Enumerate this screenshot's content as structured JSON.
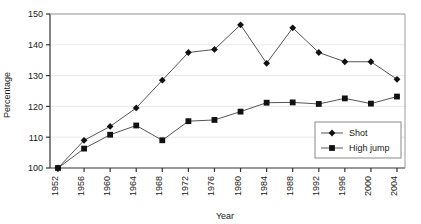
{
  "chart_data": {
    "type": "line",
    "title": "",
    "xlabel": "Year",
    "ylabel": "Percentage",
    "categories": [
      1952,
      1956,
      1960,
      1964,
      1968,
      1972,
      1976,
      1980,
      1984,
      1988,
      1992,
      1996,
      2000,
      2004
    ],
    "xtick_labels": [
      "1952",
      "1956",
      "1960",
      "1964",
      "1968",
      "1972",
      "1976",
      "1980",
      "1984",
      "1988",
      "1992",
      "1996",
      "2000",
      "2004"
    ],
    "ytick_labels": [
      "100",
      "110",
      "120",
      "130",
      "140",
      "150"
    ],
    "yticks": [
      100,
      110,
      120,
      130,
      140,
      150
    ],
    "ylim": [
      100,
      150
    ],
    "xlim": [
      1950,
      2006
    ],
    "grid": true,
    "legend_position": "bottom-right",
    "series": [
      {
        "name": "Shot",
        "marker": "diamond",
        "color": "#1a1a1a",
        "values": [
          100.0,
          109.0,
          113.5,
          119.5,
          128.5,
          137.5,
          138.5,
          146.5,
          134.0,
          145.5,
          137.5,
          134.5,
          134.5,
          128.8
        ]
      },
      {
        "name": "High jump",
        "marker": "square",
        "color": "#1a1a1a",
        "values": [
          100.0,
          106.3,
          110.8,
          113.8,
          109.0,
          115.2,
          115.6,
          118.3,
          121.2,
          121.3,
          120.8,
          122.6,
          120.9,
          123.2
        ]
      }
    ]
  },
  "legend": {
    "items": [
      {
        "label": "Shot"
      },
      {
        "label": "High jump"
      }
    ]
  },
  "colors": {
    "line": "#555555",
    "marker": "#111111",
    "axis": "#333333",
    "grid": "#e8e8e8",
    "text": "#1a1a1a",
    "background": "#ffffff"
  }
}
